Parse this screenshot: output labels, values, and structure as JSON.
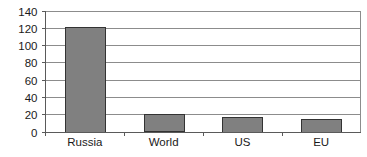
{
  "chart_data": {
    "type": "bar",
    "title": "",
    "subtitle": "",
    "xlabel": "",
    "ylabel": "",
    "categories": [
      "Russia",
      "World",
      "US",
      "EU"
    ],
    "values": [
      121,
      20,
      17,
      15
    ],
    "ylim": [
      0,
      140
    ],
    "yticks": [
      0,
      20,
      40,
      60,
      80,
      100,
      120,
      140
    ],
    "ytick_labels": [
      "0",
      "20",
      "40",
      "60",
      "80",
      "100",
      "120",
      "140"
    ],
    "grid": true,
    "grid_axis": "y",
    "legend": false,
    "legend_position": "none",
    "series": [
      {
        "name": "",
        "values": [
          121,
          20,
          17,
          15
        ]
      }
    ],
    "annotations": []
  },
  "style": {
    "bar_fill": "#808080",
    "bar_stroke": "#333333",
    "grid_color": "#8c8c8c",
    "axis_color": "#5a5a5a",
    "text_color": "#1a1a1a",
    "background": "#ffffff"
  }
}
